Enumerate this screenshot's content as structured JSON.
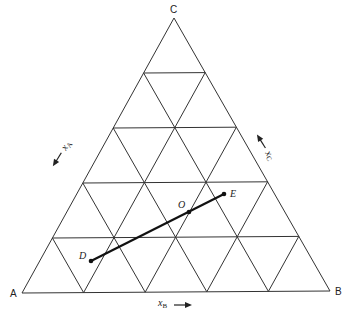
{
  "diagram": {
    "type": "ternary-phase-diagram",
    "divisions": 5,
    "vertices": {
      "A": {
        "label": "A",
        "x": 22,
        "y": 293
      },
      "B": {
        "label": "B",
        "x": 330,
        "y": 291
      },
      "C": {
        "label": "C",
        "x": 174,
        "y": 18
      }
    },
    "axis_labels": {
      "xA": {
        "label": "x",
        "sub": "A"
      },
      "xB": {
        "label": "x",
        "sub": "B"
      },
      "xC": {
        "label": "x",
        "sub": "C"
      }
    },
    "points": [
      {
        "id": "D",
        "label": "D",
        "x": 91,
        "y": 261
      },
      {
        "id": "O",
        "label": "O",
        "x": 189,
        "y": 212
      },
      {
        "id": "E",
        "label": "E",
        "x": 224,
        "y": 194
      }
    ],
    "tie_line": {
      "from": "D",
      "to": "E",
      "through": "O"
    },
    "colors": {
      "line": "#333333",
      "tie_line": "#111111",
      "background": "#ffffff"
    }
  }
}
